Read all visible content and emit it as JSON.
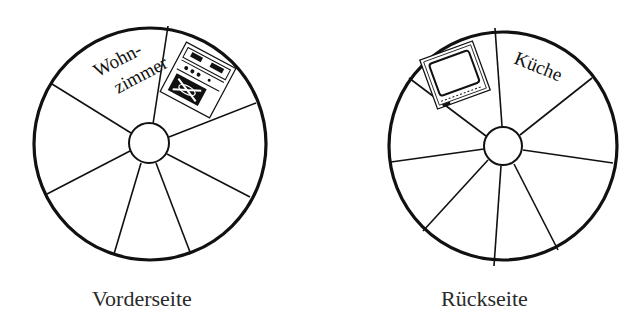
{
  "wheels": {
    "front": {
      "caption": "Vorderseite",
      "label_line1": "Wohn-",
      "label_line2": "zimmer",
      "icon": "stove-icon",
      "center": [
        150,
        144
      ],
      "radius": 116,
      "hub_radius": 20,
      "spoke_count": 7
    },
    "back": {
      "caption": "Rückseite",
      "label": "Küche",
      "icon": "tv-icon",
      "center": [
        503,
        146
      ],
      "radius": 114,
      "hub_radius": 19,
      "spoke_count": 8
    }
  },
  "colors": {
    "stroke": "#111111",
    "background": "#ffffff",
    "caption": "#2a2a2a"
  }
}
